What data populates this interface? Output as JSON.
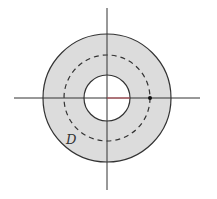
{
  "diagram": {
    "type": "annulus-region",
    "region_label": "D",
    "colors": {
      "fill": "#dcdcdc",
      "stroke": "#333333",
      "axis": "#333333",
      "radius_segment": "#c0505a",
      "background": "#ffffff"
    },
    "geometry": {
      "center": [
        107,
        98
      ],
      "outer_radius": 64,
      "inner_radius": 23,
      "dashed_radius": 43,
      "x_axis": [
        14,
        200
      ],
      "y_axis": [
        8,
        190
      ],
      "marked_point": [
        150,
        98
      ]
    }
  }
}
